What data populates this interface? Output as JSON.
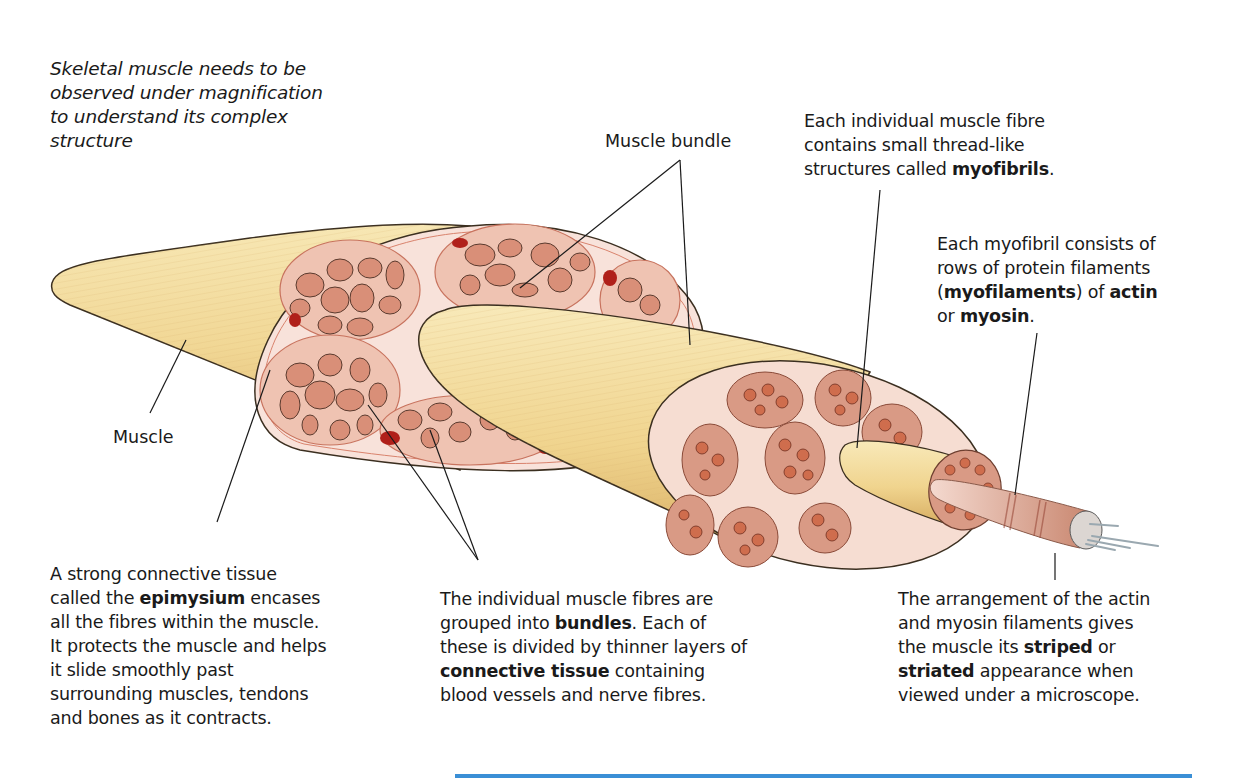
{
  "intro": {
    "lines": [
      "Skeletal muscle needs to be",
      "observed under magnification",
      "to understand its complex",
      "structure"
    ]
  },
  "labels": {
    "muscle": "Muscle",
    "muscle_bundle": "Muscle bundle"
  },
  "callouts": {
    "myofibrils": {
      "l1": "Each individual muscle fibre",
      "l2": "contains small thread-like",
      "l3_pre": "structures called ",
      "l3_bold": "myofibrils",
      "l3_post": "."
    },
    "myofilaments": {
      "l1": "Each myofibril consists of",
      "l2": "rows of protein filaments",
      "l3_open": "(",
      "l3_bold1": "myofilaments",
      "l3_mid": ") of ",
      "l3_bold2": "actin",
      "l4_pre": "or ",
      "l4_bold": "myosin",
      "l4_post": "."
    },
    "epimysium": {
      "l1": "A strong connective tissue",
      "l2_pre": "called the ",
      "l2_bold": "epimysium",
      "l2_post": " encases",
      "l3": "all the fibres within the muscle.",
      "l4": "It protects the muscle and helps",
      "l5": "it slide smoothly past",
      "l6": "surrounding muscles, tendons",
      "l7": "and bones as it contracts."
    },
    "bundles": {
      "l1": "The individual muscle fibres are",
      "l2_pre": "grouped into ",
      "l2_bold": "bundles",
      "l2_post": ". Each of",
      "l3": "these is divided by thinner layers of",
      "l4_bold": "connective tissue",
      "l4_post": " containing",
      "l5": "blood vessels and nerve fibres."
    },
    "striated": {
      "l1": "The arrangement of the actin",
      "l2": "and myosin filaments gives",
      "l3_pre": "the muscle its ",
      "l3_bold": "striped",
      "l3_post": " or",
      "l4_bold": "striated",
      "l4_post": " appearance when",
      "l5": "viewed under a microscope."
    }
  },
  "colors": {
    "muscle_yellow": "#f3dc9e",
    "muscle_shade": "#e2bf72",
    "section_pink": "#f8e2da",
    "fascicle_pink": "#efc3b2",
    "fibre_pink": "#d98f78",
    "blood_vessel": "#b0201a",
    "accent_blue": "#3a8fd6"
  }
}
